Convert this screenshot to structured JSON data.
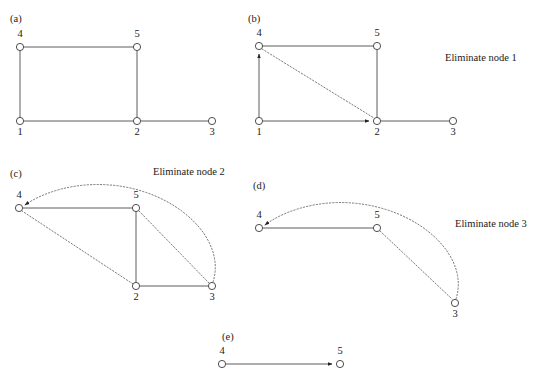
{
  "figure": {
    "background_color": "#ffffff",
    "node_stroke_color": "#3a3a3a",
    "edge_solid_color": "#4a4a4a",
    "edge_dotted_color": "#5a5a5a",
    "node_radius": 3.6
  },
  "panels": [
    {
      "id": "a",
      "label": "(a)",
      "label_pos": {
        "x": 10,
        "y": 22
      },
      "caption": "",
      "caption_pos": {
        "x": 0,
        "y": 0
      },
      "nodes": [
        {
          "name": "4",
          "x": 20,
          "y": 47,
          "label_x": 20,
          "label_y": 37
        },
        {
          "name": "5",
          "x": 137,
          "y": 47,
          "label_x": 137,
          "label_y": 37
        },
        {
          "name": "1",
          "x": 20,
          "y": 121,
          "label_x": 20,
          "label_y": 135
        },
        {
          "name": "2",
          "x": 137,
          "y": 121,
          "label_x": 137,
          "label_y": 135
        },
        {
          "name": "3",
          "x": 212,
          "y": 121,
          "label_x": 212,
          "label_y": 135
        }
      ],
      "edges": [
        {
          "from": "4",
          "to": "5",
          "style": "solid",
          "arrow": false
        },
        {
          "from": "4",
          "to": "1",
          "style": "solid",
          "arrow": false
        },
        {
          "from": "5",
          "to": "2",
          "style": "solid",
          "arrow": false
        },
        {
          "from": "1",
          "to": "2",
          "style": "solid",
          "arrow": false
        },
        {
          "from": "2",
          "to": "3",
          "style": "solid",
          "arrow": false
        }
      ]
    },
    {
      "id": "b",
      "label": "(b)",
      "label_pos": {
        "x": 248,
        "y": 22
      },
      "caption": "Eliminate node 1",
      "caption_pos": {
        "x": 445,
        "y": 61
      },
      "nodes": [
        {
          "name": "4",
          "x": 259,
          "y": 46,
          "label_x": 259,
          "label_y": 36
        },
        {
          "name": "5",
          "x": 377,
          "y": 46,
          "label_x": 377,
          "label_y": 36
        },
        {
          "name": "1",
          "x": 259,
          "y": 121,
          "label_x": 259,
          "label_y": 135
        },
        {
          "name": "2",
          "x": 377,
          "y": 121,
          "label_x": 377,
          "label_y": 135
        },
        {
          "name": "3",
          "x": 453,
          "y": 121,
          "label_x": 453,
          "label_y": 135
        }
      ],
      "edges": [
        {
          "from": "4",
          "to": "5",
          "style": "solid",
          "arrow": false
        },
        {
          "from": "1",
          "to": "4",
          "style": "solid",
          "arrow": true
        },
        {
          "from": "5",
          "to": "2",
          "style": "solid",
          "arrow": false
        },
        {
          "from": "1",
          "to": "2",
          "style": "solid",
          "arrow": true
        },
        {
          "from": "2",
          "to": "3",
          "style": "solid",
          "arrow": false
        },
        {
          "from": "4",
          "to": "2",
          "style": "dotted",
          "arrow": false
        }
      ]
    },
    {
      "id": "c",
      "label": "(c)",
      "label_pos": {
        "x": 10,
        "y": 177
      },
      "caption": "Eliminate node 2",
      "caption_pos": {
        "x": 153,
        "y": 175
      },
      "nodes": [
        {
          "name": "4",
          "x": 19,
          "y": 208,
          "label_x": 19,
          "label_y": 198
        },
        {
          "name": "5",
          "x": 136,
          "y": 208,
          "label_x": 136,
          "label_y": 198
        },
        {
          "name": "2",
          "x": 136,
          "y": 286,
          "label_x": 136,
          "label_y": 300
        },
        {
          "name": "3",
          "x": 212,
          "y": 286,
          "label_x": 212,
          "label_y": 300
        }
      ],
      "edges": [
        {
          "from": "4",
          "to": "5",
          "style": "solid",
          "arrow": false
        },
        {
          "from": "5",
          "to": "2",
          "style": "solid",
          "arrow": false
        },
        {
          "from": "2",
          "to": "3",
          "style": "solid",
          "arrow": false
        },
        {
          "from": "2",
          "to": "4",
          "style": "dotted",
          "arrow": false
        },
        {
          "from": "5",
          "to": "3",
          "style": "dotted",
          "arrow": false
        },
        {
          "from": "3",
          "to": "4",
          "style": "dotted-arc",
          "arrow": true
        }
      ]
    },
    {
      "id": "d",
      "label": "(d)",
      "label_pos": {
        "x": 253,
        "y": 189
      },
      "caption": "Eliminate node 3",
      "caption_pos": {
        "x": 455,
        "y": 227
      },
      "nodes": [
        {
          "name": "4",
          "x": 259,
          "y": 228,
          "label_x": 259,
          "label_y": 218
        },
        {
          "name": "5",
          "x": 377,
          "y": 228,
          "label_x": 377,
          "label_y": 218
        },
        {
          "name": "3",
          "x": 455,
          "y": 303,
          "label_x": 455,
          "label_y": 317
        }
      ],
      "edges": [
        {
          "from": "4",
          "to": "5",
          "style": "solid",
          "arrow": false
        },
        {
          "from": "5",
          "to": "3",
          "style": "dotted",
          "arrow": false
        },
        {
          "from": "3",
          "to": "4",
          "style": "dotted-arc",
          "arrow": true
        }
      ]
    },
    {
      "id": "e",
      "label": "(e)",
      "label_pos": {
        "x": 222,
        "y": 340
      },
      "caption": "",
      "caption_pos": {
        "x": 0,
        "y": 0
      },
      "nodes": [
        {
          "name": "4",
          "x": 222,
          "y": 364,
          "label_x": 222,
          "label_y": 354
        },
        {
          "name": "5",
          "x": 340,
          "y": 364,
          "label_x": 340,
          "label_y": 354
        }
      ],
      "edges": [
        {
          "from": "4",
          "to": "5",
          "style": "solid",
          "arrow": true
        }
      ]
    }
  ]
}
